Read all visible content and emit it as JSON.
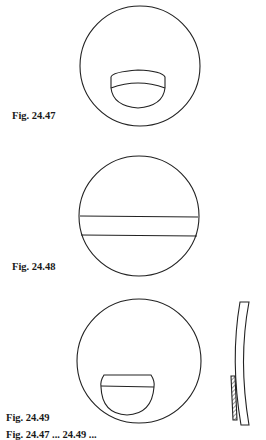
{
  "figures": [
    {
      "label": "Fig. 24.47",
      "description": "circle with curved-top segment inset in lower half"
    },
    {
      "label": "Fig. 24.48",
      "description": "circle with horizontal band across center"
    },
    {
      "label": "Fig. 24.49",
      "description": "circle with flat-top segment inset in lower half, with curved side profile showing hatched section"
    }
  ],
  "cutoff_text": "Fig. 24.47 ... 24.49 ..."
}
